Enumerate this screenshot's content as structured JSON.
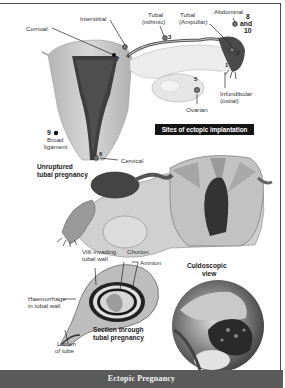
{
  "figure": {
    "title": "Ectopic Pregnancy",
    "colors": {
      "frame": "#4a4a4a",
      "caption_bar": "#5a5a5a",
      "badge": "#141414",
      "uterus_tissue": "#c9c9c9",
      "endometrium": "#3a3a3a"
    }
  },
  "panel_sites": {
    "badge": "Sites of ectopic implantation",
    "labels": {
      "cornual": "Cornual",
      "interstitial": "Interstitial",
      "tubal_isthmic_1": "Tubal",
      "tubal_isthmic_2": "(isthmic)",
      "tubal_ampullar_1": "Tubal",
      "tubal_ampullar_2": "(Ampullar)",
      "abdominal": "Abdominal",
      "abdominal_nums_1": "8",
      "abdominal_nums_2": "and",
      "abdominal_nums_3": "10",
      "infundibular_1": "Infundibular",
      "infundibular_2": "(ostial)",
      "ovarian": "Ovarian",
      "broad_ligament_num": "9",
      "broad_ligament_1": "Broad",
      "broad_ligament_2": "ligament",
      "cervical": "Cervical"
    },
    "site_numbers": {
      "n1": "1",
      "n2": "2",
      "n3": "3",
      "n4": "4",
      "n5": "5",
      "n6": "6",
      "n7": "7"
    }
  },
  "panel_unruptured": {
    "label_1": "Unruptured",
    "label_2": "tubal pregnancy"
  },
  "panel_section": {
    "villi_1": "Villi invading",
    "villi_2": "tubal wall",
    "chorion": "Chorion",
    "amnion": "Amnion",
    "haemorrhage_1": "Haemorrhage",
    "haemorrhage_2": "in tubal wall",
    "lumen_1": "Lumen",
    "lumen_2": "of tube",
    "caption_1": "Section through",
    "caption_2": "tubal pregnancy"
  },
  "panel_culdoscopic": {
    "label_1": "Culdoscopic",
    "label_2": "view"
  }
}
